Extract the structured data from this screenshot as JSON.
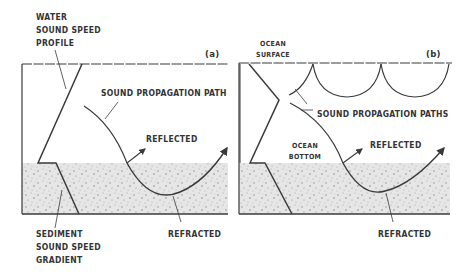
{
  "panel_a": {
    "tag": "(a)",
    "labels": {
      "water_profile": [
        "WATER",
        "SOUND SPEED",
        "PROFILE"
      ],
      "path": "SOUND PROPAGATION PATH",
      "reflected": "REFLECTED",
      "refracted": "REFRACTED",
      "sediment": [
        "SEDIMENT",
        "SOUND SPEED",
        "GRADIENT"
      ]
    }
  },
  "panel_b": {
    "tag": "(b)",
    "labels": {
      "surface": [
        "OCEAN",
        "SURFACE"
      ],
      "paths": "SOUND PROPAGATION PATHS",
      "bottom": [
        "OCEAN",
        "BOTTOM"
      ],
      "reflected": "REFLECTED",
      "refracted": "REFRACTED"
    }
  },
  "colors": {
    "line": "#3a3a3a",
    "sediment": "#d8d8d8"
  }
}
